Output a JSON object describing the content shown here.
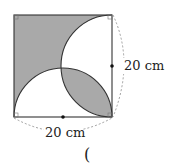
{
  "figure": {
    "right_label": "20 cm",
    "bottom_label": "20 cm",
    "answer_paren": "(",
    "colors": {
      "shade": "#a9a9a9",
      "stroke": "#333333",
      "dashed": "#888888"
    }
  }
}
